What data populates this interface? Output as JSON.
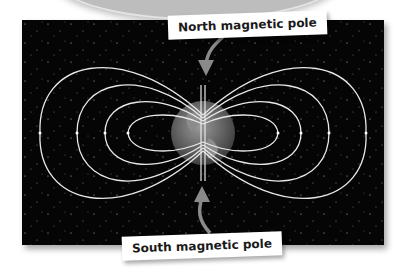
{
  "diagram": {
    "labels": {
      "north": "North magnetic pole",
      "south": "South magnetic pole"
    },
    "colors": {
      "background": "#050505",
      "field_lines": "#e8e8e8",
      "arrow": "#8a8a8a",
      "earth": "#6e6e6e"
    },
    "field_line_loops_per_side": 4
  }
}
